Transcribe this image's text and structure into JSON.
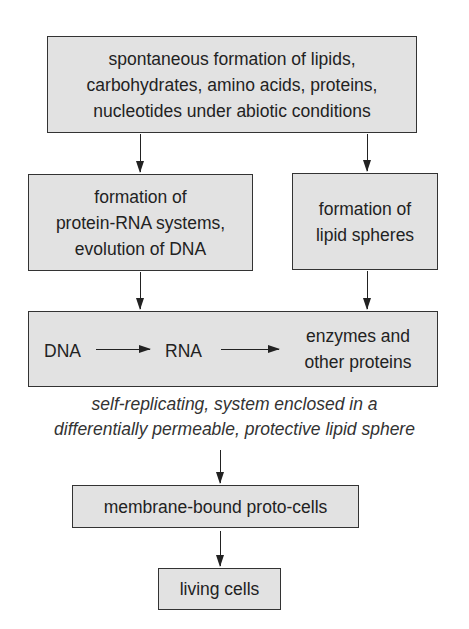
{
  "diagram": {
    "type": "flowchart",
    "direction": "top-to-bottom",
    "colors": {
      "box_fill": "#e2e2e2",
      "box_border": "#333333",
      "text": "#222222",
      "background": "#ffffff"
    },
    "nodes": {
      "abiotic_synthesis": {
        "lines": [
          "spontaneous formation of lipids,",
          "carbohydrates, amino acids, proteins,",
          "nucleotides under abiotic conditions"
        ]
      },
      "protein_rna": {
        "lines": [
          "formation of",
          "protein-RNA systems,",
          "evolution of DNA"
        ]
      },
      "lipid_spheres": {
        "lines": [
          "formation of",
          "lipid spheres"
        ]
      },
      "central_dogma": {
        "dna": "DNA",
        "rna": "RNA",
        "proteins_lines": [
          "enzymes and",
          "other proteins"
        ]
      },
      "proto_cells": {
        "label": "membrane-bound proto-cells"
      },
      "living_cells": {
        "label": "living cells"
      }
    },
    "caption": {
      "lines": [
        "self-replicating, system enclosed in a",
        "differentially permeable, protective lipid sphere"
      ]
    },
    "edges": [
      {
        "from": "abiotic_synthesis",
        "to": "protein_rna"
      },
      {
        "from": "abiotic_synthesis",
        "to": "lipid_spheres"
      },
      {
        "from": "protein_rna",
        "to": "central_dogma"
      },
      {
        "from": "lipid_spheres",
        "to": "central_dogma"
      },
      {
        "from": "DNA",
        "to": "RNA"
      },
      {
        "from": "RNA",
        "to": "enzymes and other proteins"
      },
      {
        "from": "central_dogma",
        "to": "proto_cells"
      },
      {
        "from": "proto_cells",
        "to": "living_cells"
      }
    ]
  }
}
